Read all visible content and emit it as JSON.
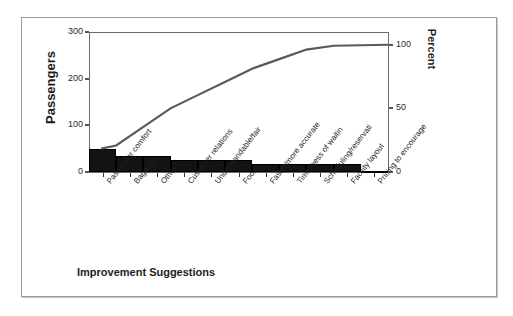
{
  "chart_data": {
    "type": "bar",
    "chart_kind": "pareto",
    "title": "",
    "xlabel": "Improvement Suggestions",
    "ylabel": "Passengers",
    "y2label": "Percent",
    "ylim": [
      0,
      300
    ],
    "y2lim": [
      0,
      110
    ],
    "grid": false,
    "legend": "none",
    "y_ticks": [
      "0",
      "100",
      "200",
      "300"
    ],
    "y_tick_values": [
      0,
      100,
      200,
      300
    ],
    "y2_ticks": [
      "0",
      "50",
      "100"
    ],
    "y2_tick_values": [
      0,
      50,
      100
    ],
    "categories": [
      "Passenger comfort",
      "Baggage",
      "Other",
      "Customer relations",
      "Understandable/fair",
      "Food",
      "Faster/more accurate",
      "Timeliness of waitin",
      "Scheduling/reservati",
      "Facility layout",
      "Pricing to encourage"
    ],
    "values": [
      50,
      35,
      35,
      25,
      25,
      25,
      18,
      18,
      18,
      18,
      2
    ],
    "cumulative_percent": [
      20.8,
      35.4,
      50.0,
      60.4,
      70.8,
      81.2,
      88.7,
      96.2,
      99.2,
      99.6,
      100.0
    ],
    "series": [
      {
        "name": "Passengers",
        "type": "bar",
        "values": [
          50,
          35,
          35,
          25,
          25,
          25,
          18,
          18,
          18,
          18,
          2
        ]
      },
      {
        "name": "Cumulative Percent",
        "type": "line",
        "values": [
          20.8,
          35.4,
          50.0,
          60.4,
          70.8,
          81.2,
          88.7,
          96.2,
          99.2,
          99.6,
          100.0
        ]
      }
    ],
    "colors": {
      "bar": "#131313",
      "line": "#5a5a5a",
      "axis": "#6b6b6b",
      "text": "#1d1d1d",
      "frame": "#9a9a9a",
      "background": "#ffffff"
    }
  },
  "axes": {
    "left_title": "Passengers",
    "right_title": "Percent",
    "bottom_title": "Improvement Suggestions"
  }
}
